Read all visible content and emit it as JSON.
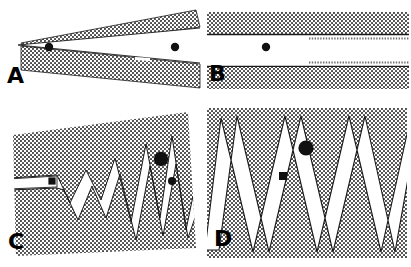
{
  "figure": {
    "width": 411,
    "height": 267,
    "background_color": "#ffffff",
    "ink_color": "#000000",
    "stipple_color": "#3a3a3a",
    "panel_count": 4,
    "layout": "2x2 grid of line-drawing panels"
  },
  "panels": [
    {
      "id": "a",
      "label": "A",
      "description": "Tapering wedge: two stippled bands converging leftward to a closed apex, opening rightward into a white gap",
      "stipple_regions": 2,
      "markers": [
        {
          "name": "apex-marker",
          "shape": "circle",
          "cx": 49,
          "cy": 47,
          "r": 4.2
        },
        {
          "name": "gap-marker",
          "shape": "circle",
          "cx": 175,
          "cy": 47,
          "r": 4.2
        }
      ]
    },
    {
      "id": "b",
      "label": "B",
      "description": "Two parallel horizontal stippled bands separated by a uniform white gap, with a single central dot",
      "stipple_regions": 2,
      "markers": [
        {
          "name": "gap-marker",
          "shape": "circle",
          "cx": 61,
          "cy": 47,
          "r": 4.2
        }
      ]
    },
    {
      "id": "c",
      "label": "C",
      "description": "Tilted stippled field cut by a white zigzag channel whose amplitude grows from left to right; channel enters as a thin horizontal slot",
      "stipple_regions": 1,
      "zigzag_cycles": 5,
      "markers": [
        {
          "name": "entry-marker",
          "shape": "square",
          "cx": 52,
          "cy": 81,
          "r": 3.6
        },
        {
          "name": "peak-marker-large",
          "shape": "circle",
          "cx": 161,
          "cy": 59,
          "r": 7.2
        },
        {
          "name": "lower-marker-small",
          "shape": "circle",
          "cx": 172,
          "cy": 81,
          "r": 4.0
        }
      ]
    },
    {
      "id": "d",
      "label": "D",
      "description": "Rectangular stippled frame fully traversed by a high-amplitude white zigzag channel of uniform period",
      "stipple_regions": 1,
      "zigzag_cycles": 6,
      "markers": [
        {
          "name": "peak-marker-large",
          "shape": "circle",
          "cx": 101,
          "cy": 48,
          "r": 7.6
        },
        {
          "name": "lower-marker-small",
          "shape": "square",
          "cx": 78,
          "cy": 76,
          "r": 4.0
        }
      ]
    }
  ]
}
